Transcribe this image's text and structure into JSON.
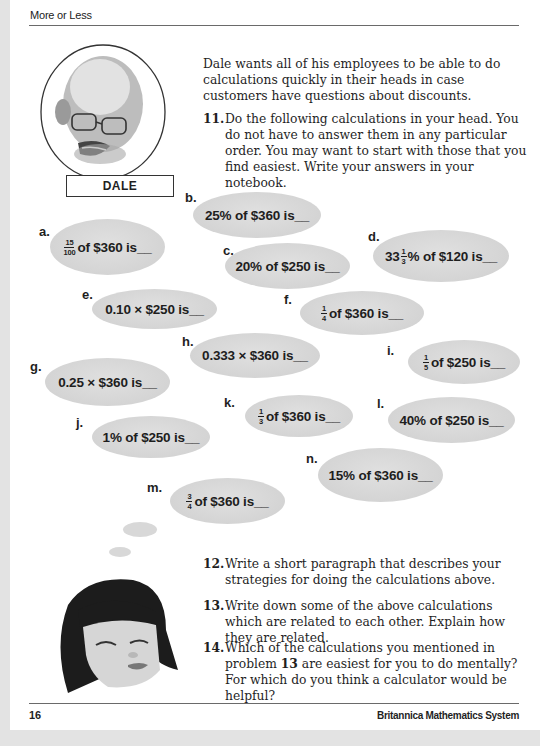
{
  "header": {
    "title": "More or Less"
  },
  "character_top": {
    "name": "DALE"
  },
  "intro": "Dale wants all of his employees to be able to do calculations quickly in their heads in case customers have questions about discounts.",
  "questions": [
    {
      "num": "11.",
      "text": "Do the following calculations in your head. You do not have to answer them in any particular order. You may want to start with those that you find easiest. Write your answers in your notebook."
    },
    {
      "num": "12.",
      "text": "Write a short paragraph that describes your strategies for doing the calculations above."
    },
    {
      "num": "13.",
      "text": "Write down some of the above calculations which are related to each other. Explain how they are related."
    },
    {
      "num": "14.",
      "text_before": "Which of the calculations you mentioned in problem ",
      "bold_ref": "13",
      "text_after": " are easiest for you to do mentally? For which do you think a calculator would be helpful?"
    }
  ],
  "calculations": {
    "a": {
      "label": "a.",
      "frac_n": "15",
      "frac_d": "100",
      "text": "of $360 is__"
    },
    "b": {
      "label": "b.",
      "text": "25% of $360 is__"
    },
    "c": {
      "label": "c.",
      "text": "20% of $250 is__"
    },
    "d": {
      "label": "d.",
      "whole": "33",
      "frac_n": "1",
      "frac_d": "3",
      "text": "% of $120 is__"
    },
    "e": {
      "label": "e.",
      "text": "0.10 × $250 is__"
    },
    "f": {
      "label": "f.",
      "frac_n": "1",
      "frac_d": "4",
      "text": "of $360 is__"
    },
    "g": {
      "label": "g.",
      "text": "0.25 × $360 is__"
    },
    "h": {
      "label": "h.",
      "text": "0.333 × $360 is__"
    },
    "i": {
      "label": "i.",
      "frac_n": "1",
      "frac_d": "5",
      "text": "of $250 is__"
    },
    "j": {
      "label": "j.",
      "text": "1% of $250 is__"
    },
    "k": {
      "label": "k.",
      "frac_n": "1",
      "frac_d": "3",
      "text": "of $360 is__"
    },
    "l": {
      "label": "l.",
      "text": "40% of $250 is__"
    },
    "m": {
      "label": "m.",
      "frac_n": "3",
      "frac_d": "4",
      "text": "of $360 is__"
    },
    "n": {
      "label": "n.",
      "text": "15% of $360 is__"
    }
  },
  "footer": {
    "page_number": "16",
    "publisher": "Britannica Mathematics System"
  }
}
